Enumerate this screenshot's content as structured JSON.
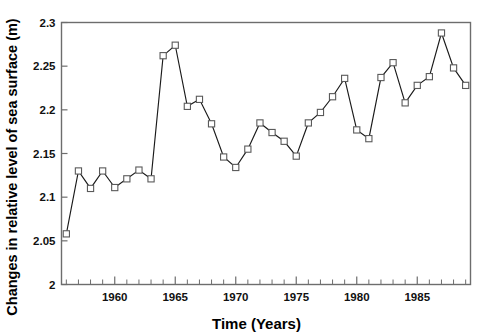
{
  "chart_data": {
    "type": "line",
    "title": "",
    "xlabel": "Time (Years)",
    "ylabel": "Changes in relative level of sea surface (m)",
    "xlim": [
      1955.6,
      1989.4
    ],
    "ylim": [
      2.0,
      2.3
    ],
    "grid": false,
    "legend": null,
    "marker": "open-square",
    "xticks": [
      1960,
      1965,
      1970,
      1975,
      1980,
      1985
    ],
    "xtick_labels": [
      "1960",
      "1965",
      "1970",
      "1975",
      "1980",
      "1985"
    ],
    "x_minor_tick_interval": 1,
    "yticks": [
      2,
      2.05,
      2.1,
      2.15,
      2.2,
      2.25,
      2.3
    ],
    "ytick_labels": [
      "2",
      "2.05",
      "2.1",
      "2.15",
      "2.2",
      "2.25",
      "2.3"
    ],
    "x": [
      1956,
      1957,
      1958,
      1959,
      1960,
      1961,
      1962,
      1963,
      1964,
      1965,
      1966,
      1967,
      1968,
      1969,
      1970,
      1971,
      1972,
      1973,
      1974,
      1975,
      1976,
      1977,
      1978,
      1979,
      1980,
      1981,
      1982,
      1983,
      1984,
      1985,
      1986,
      1987,
      1988,
      1989
    ],
    "values": [
      2.058,
      2.13,
      2.11,
      2.13,
      2.111,
      2.121,
      2.131,
      2.121,
      2.262,
      2.274,
      2.204,
      2.212,
      2.184,
      2.146,
      2.134,
      2.155,
      2.185,
      2.174,
      2.164,
      2.147,
      2.185,
      2.197,
      2.215,
      2.236,
      2.177,
      2.167,
      2.237,
      2.254,
      2.208,
      2.228,
      2.238,
      2.288,
      2.248,
      2.228
    ],
    "series": [
      {
        "name": "relative sea surface level",
        "values": [
          2.058,
          2.13,
          2.11,
          2.13,
          2.111,
          2.121,
          2.131,
          2.121,
          2.262,
          2.274,
          2.204,
          2.212,
          2.184,
          2.146,
          2.134,
          2.155,
          2.185,
          2.174,
          2.164,
          2.147,
          2.185,
          2.197,
          2.215,
          2.236,
          2.177,
          2.167,
          2.237,
          2.254,
          2.208,
          2.228,
          2.238,
          2.288,
          2.248,
          2.228
        ]
      }
    ]
  },
  "axes": {
    "y_label": "Changes in relative level of sea surface (m)",
    "x_label": "Time (Years)"
  },
  "colors": {
    "line": "#1a1a1a",
    "marker_fill": "#ffffff",
    "marker_stroke": "#5a5a5a",
    "frame": "#6d6d6d",
    "text": "#111111",
    "background": "#ffffff"
  }
}
